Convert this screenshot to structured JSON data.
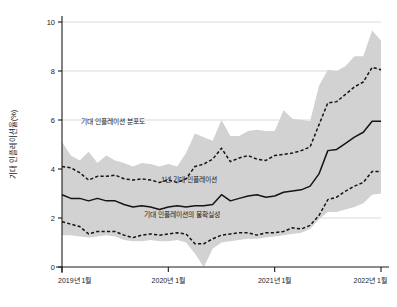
{
  "chart_data": {
    "type": "area",
    "title": "",
    "xlabel": "",
    "ylabel": "기대 인플레이션율(%)",
    "ylim": [
      0,
      10
    ],
    "yticks": [
      0,
      2,
      4,
      6,
      8,
      10
    ],
    "ytick_labels": [
      "0",
      "2",
      "4",
      "6",
      "8",
      "10"
    ],
    "xtick_labels": [
      "2019년 1월",
      "2020년 1월",
      "2021년 1월",
      "2022년 1월"
    ],
    "xtick_index": [
      0,
      12,
      24,
      36
    ],
    "grid": true,
    "legend_position": "inline-annotations",
    "x": [
      "2019-01",
      "2019-02",
      "2019-03",
      "2019-04",
      "2019-05",
      "2019-06",
      "2019-07",
      "2019-08",
      "2019-09",
      "2019-10",
      "2019-11",
      "2019-12",
      "2020-01",
      "2020-02",
      "2020-03",
      "2020-04",
      "2020-05",
      "2020-06",
      "2020-07",
      "2020-08",
      "2020-09",
      "2020-10",
      "2020-11",
      "2020-12",
      "2021-01",
      "2021-02",
      "2021-03",
      "2021-04",
      "2021-05",
      "2021-06",
      "2021-07",
      "2021-08",
      "2021-09",
      "2021-10",
      "2021-11",
      "2021-12",
      "2022-01"
    ],
    "series": [
      {
        "name": "기대 인플레이션 분포도",
        "style": "shaded-band",
        "color": "#d2d2d2",
        "upper": [
          5.1,
          4.55,
          4.35,
          4.7,
          4.25,
          4.55,
          4.35,
          4.25,
          4.1,
          4.25,
          4.2,
          4.1,
          4.2,
          4.1,
          4.65,
          5.45,
          5.3,
          5.15,
          6.0,
          5.35,
          5.35,
          5.55,
          5.6,
          5.55,
          5.55,
          6.4,
          6.05,
          6.0,
          5.95,
          7.4,
          8.05,
          8.0,
          8.2,
          8.6,
          8.6,
          9.65,
          9.25
        ],
        "lower": [
          1.3,
          1.3,
          1.25,
          1.2,
          1.25,
          1.3,
          1.25,
          1.1,
          1.05,
          1.05,
          1.1,
          1.05,
          1.05,
          1.1,
          1.0,
          0.55,
          0.0,
          0.75,
          1.0,
          1.05,
          1.1,
          1.15,
          1.15,
          1.2,
          1.25,
          1.3,
          1.35,
          1.4,
          1.55,
          1.95,
          2.25,
          2.25,
          2.35,
          2.45,
          2.6,
          2.95,
          3.0
        ]
      },
      {
        "name": "기대 인플레이션의 불확실성 (상단)",
        "style": "dashed",
        "color": "#141414",
        "values": [
          4.1,
          4.05,
          3.85,
          3.55,
          3.7,
          3.7,
          3.75,
          3.6,
          3.55,
          3.6,
          3.55,
          3.45,
          3.55,
          3.45,
          3.6,
          4.1,
          4.2,
          4.4,
          4.85,
          4.3,
          4.45,
          4.55,
          4.4,
          4.35,
          4.55,
          4.6,
          4.65,
          4.75,
          4.9,
          5.8,
          6.7,
          6.75,
          7.05,
          7.35,
          7.55,
          8.15,
          8.05
        ]
      },
      {
        "name": "1년 기대 인플레이션",
        "style": "solid",
        "color": "#141414",
        "values": [
          2.95,
          2.8,
          2.8,
          2.7,
          2.8,
          2.7,
          2.7,
          2.55,
          2.45,
          2.5,
          2.45,
          2.35,
          2.45,
          2.5,
          2.45,
          2.5,
          2.5,
          2.55,
          2.95,
          2.7,
          2.8,
          2.9,
          2.95,
          2.85,
          2.9,
          3.05,
          3.1,
          3.15,
          3.3,
          3.8,
          4.75,
          4.8,
          5.05,
          5.3,
          5.5,
          5.95,
          5.95
        ]
      },
      {
        "name": "기대 인플레이션의 불확실성 (하단)",
        "style": "dashed",
        "color": "#141414",
        "values": [
          1.85,
          1.75,
          1.65,
          1.35,
          1.45,
          1.45,
          1.45,
          1.3,
          1.2,
          1.3,
          1.35,
          1.3,
          1.35,
          1.4,
          1.35,
          0.95,
          0.95,
          1.15,
          1.3,
          1.35,
          1.4,
          1.4,
          1.3,
          1.4,
          1.4,
          1.45,
          1.6,
          1.55,
          1.7,
          2.1,
          2.75,
          2.85,
          3.1,
          3.3,
          3.45,
          3.9,
          3.9
        ]
      }
    ],
    "annotations": [
      {
        "text": "기대 인플레이션 분포도",
        "x_index": 2.2,
        "y_value": 5.85
      },
      {
        "text": "1년 기대 인플레이션",
        "x_index": 11.2,
        "y_value": 3.45
      },
      {
        "text": "기대 인플레이션의 불확실성",
        "x_index": 9.3,
        "y_value": 2.05
      }
    ]
  }
}
